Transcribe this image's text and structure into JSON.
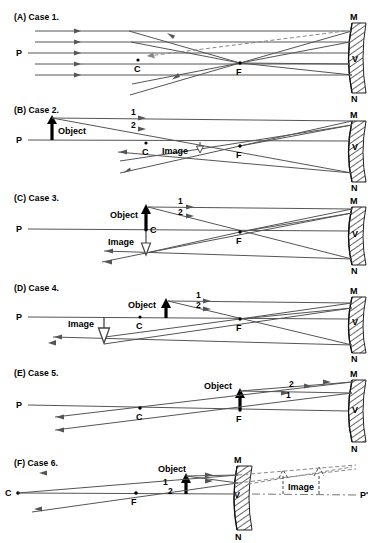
{
  "figure": {
    "title_visible": false,
    "background": "#ffffff",
    "ink": "#1a1a1a",
    "ray_color": "#555555",
    "object_color": "#000000",
    "mirror_hatch_color": "#333333"
  },
  "panels": [
    {
      "id": "case1",
      "label": "(A) Case 1.",
      "axis_label": "P",
      "mirror_labels": {
        "top": "M",
        "vertex": "V",
        "bottom": "N"
      },
      "points": [
        {
          "name": "C",
          "label": "C"
        },
        {
          "name": "F",
          "label": "F"
        }
      ],
      "object": null,
      "image": null,
      "ray_labels": [],
      "description_visible_text": [
        "P",
        "C",
        "F",
        "M",
        "V",
        "N"
      ]
    },
    {
      "id": "case2",
      "label": "(B) Case 2.",
      "axis_label": "P",
      "mirror_labels": {
        "top": "M",
        "vertex": "V",
        "bottom": "N"
      },
      "points": [
        {
          "name": "C",
          "label": "C"
        },
        {
          "name": "F",
          "label": "F"
        }
      ],
      "object": {
        "label": "Object",
        "direction": "up",
        "fill": "solid"
      },
      "image": {
        "label": "Image",
        "direction": "down",
        "fill": "hollow"
      },
      "ray_labels": [
        "1",
        "2"
      ],
      "description_visible_text": [
        "P",
        "Object",
        "Image",
        "C",
        "F",
        "M",
        "V",
        "N",
        "1",
        "2"
      ]
    },
    {
      "id": "case3",
      "label": "(C) Case 3.",
      "axis_label": "P",
      "mirror_labels": {
        "top": "M",
        "vertex": "V",
        "bottom": "N"
      },
      "points": [
        {
          "name": "C",
          "label": "C"
        },
        {
          "name": "F",
          "label": "F"
        }
      ],
      "object": {
        "label": "Object",
        "direction": "up",
        "fill": "solid"
      },
      "image": {
        "label": "Image",
        "direction": "down",
        "fill": "hollow"
      },
      "ray_labels": [
        "1",
        "2"
      ],
      "description_visible_text": [
        "P",
        "Object",
        "Image",
        "C",
        "F",
        "M",
        "V",
        "N",
        "1",
        "2"
      ]
    },
    {
      "id": "case4",
      "label": "(D) Case 4.",
      "axis_label": "P",
      "mirror_labels": {
        "top": "M",
        "vertex": "V",
        "bottom": "N"
      },
      "points": [
        {
          "name": "C",
          "label": "C"
        },
        {
          "name": "F",
          "label": "F"
        }
      ],
      "object": {
        "label": "Object",
        "direction": "up",
        "fill": "solid"
      },
      "image": {
        "label": "Image",
        "direction": "down",
        "fill": "hollow"
      },
      "ray_labels": [
        "1",
        "2"
      ],
      "description_visible_text": [
        "P",
        "Object",
        "Image",
        "C",
        "F",
        "M",
        "V",
        "N",
        "1",
        "2"
      ]
    },
    {
      "id": "case5",
      "label": "(E) Case 5.",
      "axis_label": "P",
      "mirror_labels": {
        "top": "M",
        "vertex": "V",
        "bottom": "N"
      },
      "points": [
        {
          "name": "C",
          "label": "C"
        },
        {
          "name": "F",
          "label": "F"
        }
      ],
      "object": {
        "label": "Object",
        "direction": "up",
        "fill": "solid"
      },
      "image": null,
      "ray_labels": [
        "1",
        "2"
      ],
      "description_visible_text": [
        "P",
        "Object",
        "C",
        "F",
        "M",
        "V",
        "N",
        "1",
        "2"
      ]
    },
    {
      "id": "case6",
      "label": "(F) Case 6.",
      "axis_label": "P'",
      "mirror_labels": {
        "top": "M",
        "vertex": "V",
        "bottom": "N"
      },
      "points": [
        {
          "name": "C",
          "label": "C"
        },
        {
          "name": "F",
          "label": "F"
        }
      ],
      "object": {
        "label": "Object",
        "direction": "up",
        "fill": "solid"
      },
      "image": {
        "label": "Image",
        "direction": "up",
        "fill": "dashed-virtual"
      },
      "ray_labels": [
        "1",
        "2"
      ],
      "description_visible_text": [
        "C",
        "F",
        "Object",
        "Image",
        "M",
        "V",
        "N",
        "P'",
        "1",
        "2"
      ]
    }
  ]
}
